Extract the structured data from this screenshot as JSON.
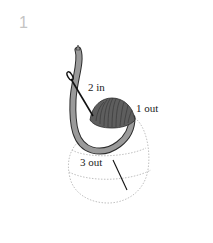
{
  "step": {
    "number": "1"
  },
  "labels": {
    "in2": "2 in",
    "out1": "1 out",
    "out3": "3 out"
  },
  "colors": {
    "thread": "#9a9a9a",
    "thread_outline": "#2b2b2b",
    "shell": "#5e5e5e",
    "needle": "#111111",
    "dotted_outline": "#b0b0b0",
    "step_number": "#c4c4c4"
  }
}
